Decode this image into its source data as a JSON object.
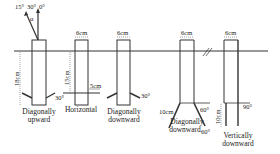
{
  "diagram": {
    "top_angles": {
      "a15": "15°",
      "a30": "30°",
      "a0": "0°",
      "alpha": "α"
    },
    "dimensions": {
      "depth_18": "18cm",
      "depth_15": "15cm",
      "width_1": "6cm",
      "width_2": "6cm",
      "width_3": "6cm",
      "width_4": "6cm",
      "len_5": "5cm",
      "len_10a": "10cm",
      "len_10b": "10cm"
    },
    "angles": {
      "up_30": "30°",
      "down_30": "30°",
      "down_60a": "60°",
      "down_60b": "60°",
      "vert_90": "90°"
    },
    "labels": {
      "up_1": "Diagonally",
      "up_2": "upward",
      "horizontal": "Horizontal",
      "down_1": "Diagonally",
      "down_2": "downward",
      "down60_1": "Diagonally",
      "down60_2": "downward",
      "vert_1": "Vertically",
      "vert_2": "downward"
    },
    "colors": {
      "line": "#222222",
      "dim": "#555555"
    }
  }
}
